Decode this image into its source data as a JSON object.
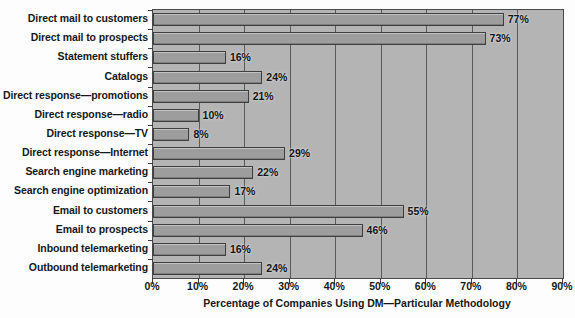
{
  "chart_data": {
    "type": "bar",
    "orientation": "horizontal",
    "title": "",
    "xlabel": "Percentage of Companies Using DM—Particular Methodology",
    "ylabel": "",
    "xlim": [
      0,
      90
    ],
    "xticks": [
      0,
      10,
      20,
      30,
      40,
      50,
      60,
      70,
      80,
      90
    ],
    "xtick_labels": [
      "0%",
      "10%",
      "20%",
      "30%",
      "40%",
      "50%",
      "60%",
      "70%",
      "80%",
      "90%"
    ],
    "grid": true,
    "grid_axis": "x",
    "legend": false,
    "value_label_suffix": "%",
    "categories": [
      "Direct mail to customers",
      "Direct mail to prospects",
      "Statement stuffers",
      "Catalogs",
      "Direct response—promotions",
      "Direct response—radio",
      "Direct response—TV",
      "Direct response—Internet",
      "Search engine marketing",
      "Search engine optimization",
      "Email to customers",
      "Email to prospects",
      "Inbound telemarketing",
      "Outbound telemarketing"
    ],
    "values": [
      77,
      73,
      16,
      24,
      21,
      10,
      8,
      29,
      22,
      17,
      55,
      46,
      16,
      24
    ],
    "value_labels": [
      "77%",
      "73%",
      "16%",
      "24%",
      "21%",
      "10%",
      "8%",
      "29%",
      "22%",
      "17%",
      "55%",
      "46%",
      "16%",
      "24%"
    ],
    "colors": {
      "bar_fill": "#9d9d9d",
      "bar_edge": "#3e3e3e",
      "plot_background": "#b4b4b4",
      "gridline": "#5a5a5a",
      "text": "#16181a",
      "figure_background": "#fdfdfd"
    }
  }
}
